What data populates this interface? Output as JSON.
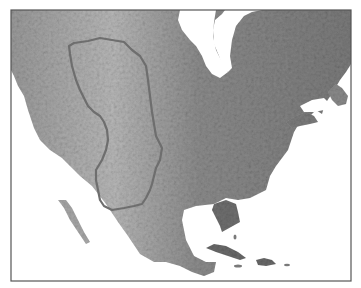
{
  "map": {
    "subject": "North America shaded relief",
    "projection_style": "grayscale hillshade",
    "highlighted_region": {
      "name": "Great Plains",
      "style": "outlined"
    },
    "visible_areas": [
      "Canada",
      "United States",
      "Mexico",
      "Hudson Bay",
      "Gulf of Mexico",
      "Cuba",
      "Hispaniola",
      "Florida",
      "Newfoundland",
      "Baja California"
    ],
    "labels": [],
    "colors": {
      "water": "#ffffff",
      "land_light": "#c8c8c8",
      "land_mid": "#8f8f8f",
      "land_dark": "#5a5a5a",
      "frame": "#555555",
      "region_outline": "#6e6e6e"
    }
  }
}
